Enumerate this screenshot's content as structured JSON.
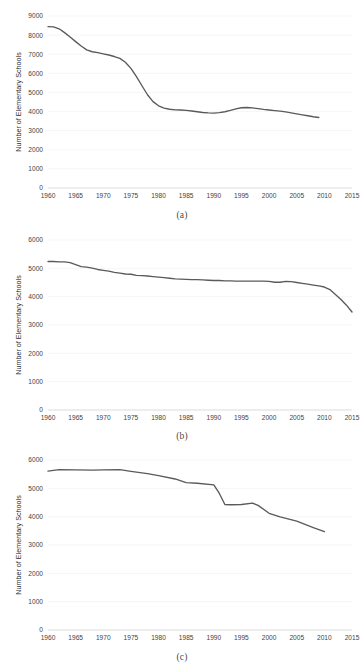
{
  "page": {
    "top_text_fragment": "",
    "line_color": "#5a5a5a",
    "grid_color": "#f2f2f2",
    "axis_color": "#d9d9d9"
  },
  "figures": [
    {
      "caption": "(a)",
      "ylabel": "Number of Elementary Schools"
    },
    {
      "caption": "(b)",
      "ylabel": "Number of Elementary Schools"
    },
    {
      "caption": "(c)",
      "ylabel": "Number of Elementary Schools"
    }
  ],
  "chart_data": [
    {
      "type": "line",
      "title": "",
      "panel": "(a)",
      "xlabel": "",
      "ylabel": "Number of Elementary Schools",
      "xlim": [
        1960,
        2015
      ],
      "ylim": [
        0,
        9000
      ],
      "xticks": [
        1960,
        1965,
        1970,
        1975,
        1980,
        1985,
        1990,
        1995,
        2000,
        2005,
        2010,
        2015
      ],
      "yticks": [
        0,
        1000,
        2000,
        3000,
        4000,
        5000,
        6000,
        7000,
        8000,
        9000
      ],
      "grid": true,
      "legend": "none",
      "series": [
        {
          "name": "Elementary Schools",
          "x": [
            1960,
            1961,
            1962,
            1963,
            1964,
            1965,
            1966,
            1967,
            1968,
            1969,
            1970,
            1971,
            1972,
            1973,
            1974,
            1975,
            1976,
            1977,
            1978,
            1979,
            1980,
            1981,
            1982,
            1983,
            1984,
            1985,
            1986,
            1987,
            1988,
            1989,
            1990,
            1991,
            1992,
            1993,
            1994,
            1995,
            1996,
            1997,
            1998,
            1999,
            2000,
            2001,
            2002,
            2003,
            2004,
            2005,
            2006,
            2007,
            2008,
            2009
          ],
          "values": [
            8440,
            8430,
            8330,
            8130,
            7900,
            7660,
            7430,
            7230,
            7130,
            7080,
            7020,
            6960,
            6880,
            6780,
            6580,
            6260,
            5830,
            5350,
            4880,
            4520,
            4300,
            4180,
            4120,
            4090,
            4080,
            4060,
            4030,
            3990,
            3950,
            3930,
            3920,
            3940,
            3990,
            4060,
            4140,
            4200,
            4210,
            4190,
            4150,
            4110,
            4080,
            4050,
            4020,
            3980,
            3930,
            3880,
            3830,
            3780,
            3730,
            3690
          ]
        }
      ]
    },
    {
      "type": "line",
      "title": "",
      "panel": "(b)",
      "xlabel": "",
      "ylabel": "Number of Elementary Schools",
      "xlim": [
        1960,
        2015
      ],
      "ylim": [
        0,
        6000
      ],
      "xticks": [
        1960,
        1965,
        1970,
        1975,
        1980,
        1985,
        1990,
        1995,
        2000,
        2005,
        2010,
        2015
      ],
      "yticks": [
        0,
        1000,
        2000,
        3000,
        4000,
        5000,
        6000
      ],
      "grid": true,
      "legend": "none",
      "series": [
        {
          "name": "Elementary Schools",
          "x": [
            1960,
            1961,
            1962,
            1963,
            1964,
            1965,
            1966,
            1967,
            1968,
            1969,
            1970,
            1971,
            1972,
            1973,
            1974,
            1975,
            1976,
            1977,
            1978,
            1979,
            1980,
            1981,
            1982,
            1983,
            1984,
            1985,
            1986,
            1987,
            1988,
            1989,
            1990,
            1991,
            1992,
            1993,
            1994,
            1995,
            1996,
            1997,
            1998,
            1999,
            2000,
            2001,
            2002,
            2003,
            2004,
            2005,
            2006,
            2007,
            2008,
            2009,
            2010,
            2011,
            2012,
            2013,
            2014,
            2015
          ],
          "values": [
            5240,
            5240,
            5230,
            5230,
            5200,
            5130,
            5060,
            5040,
            5010,
            4960,
            4930,
            4900,
            4860,
            4830,
            4800,
            4790,
            4750,
            4740,
            4730,
            4710,
            4690,
            4670,
            4650,
            4630,
            4620,
            4610,
            4600,
            4600,
            4590,
            4580,
            4570,
            4570,
            4560,
            4560,
            4550,
            4550,
            4550,
            4550,
            4550,
            4550,
            4540,
            4510,
            4510,
            4540,
            4530,
            4500,
            4470,
            4440,
            4410,
            4380,
            4340,
            4250,
            4080,
            3900,
            3700,
            3460
          ]
        }
      ]
    },
    {
      "type": "line",
      "title": "",
      "panel": "(c)",
      "xlabel": "",
      "ylabel": "Number of Elementary Schools",
      "xlim": [
        1960,
        2015
      ],
      "ylim": [
        0,
        6000
      ],
      "xticks": [
        1960,
        1965,
        1970,
        1975,
        1980,
        1985,
        1990,
        1995,
        2000,
        2005,
        2010,
        2015
      ],
      "yticks": [
        0,
        1000,
        2000,
        3000,
        4000,
        5000,
        6000
      ],
      "grid": true,
      "legend": "none",
      "series": [
        {
          "name": "Elementary Schools",
          "x": [
            1960,
            1962,
            1965,
            1968,
            1970,
            1973,
            1975,
            1978,
            1980,
            1983,
            1985,
            1987,
            1990,
            1991,
            1992,
            1993,
            1995,
            1997,
            1998,
            2000,
            2002,
            2005,
            2008,
            2010
          ],
          "values": [
            5610,
            5660,
            5650,
            5640,
            5650,
            5660,
            5600,
            5520,
            5450,
            5330,
            5200,
            5180,
            5120,
            4820,
            4430,
            4420,
            4430,
            4480,
            4400,
            4120,
            3990,
            3840,
            3610,
            3470
          ]
        }
      ]
    }
  ]
}
